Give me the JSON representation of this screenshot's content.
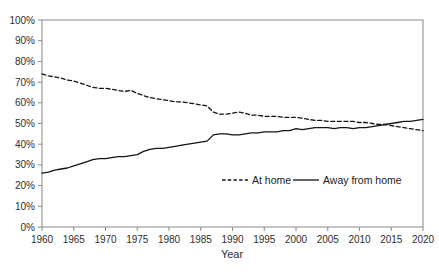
{
  "chart_data": {
    "type": "line",
    "title": "",
    "xlabel": "Year",
    "ylabel": "",
    "xlim": [
      1960,
      2020
    ],
    "ylim": [
      0,
      100
    ],
    "xtick_step": 5,
    "ytick_step": 10,
    "ytick_suffix": "%",
    "grid": false,
    "legend_position": "inside-plot-lower-right",
    "frame_color": "#8a8a8a",
    "line_color": "#141414",
    "x": [
      1960,
      1961,
      1962,
      1963,
      1964,
      1965,
      1966,
      1967,
      1968,
      1969,
      1970,
      1971,
      1972,
      1973,
      1974,
      1975,
      1976,
      1977,
      1978,
      1979,
      1980,
      1981,
      1982,
      1983,
      1984,
      1985,
      1986,
      1987,
      1988,
      1989,
      1990,
      1991,
      1992,
      1993,
      1994,
      1995,
      1996,
      1997,
      1998,
      1999,
      2000,
      2001,
      2002,
      2003,
      2004,
      2005,
      2006,
      2007,
      2008,
      2009,
      2010,
      2011,
      2012,
      2013,
      2014,
      2015,
      2016,
      2017,
      2018,
      2019,
      2020
    ],
    "series": [
      {
        "name": "At home",
        "style": "dashed",
        "color": "#141414",
        "values": [
          74,
          73,
          72.5,
          72,
          71,
          70.5,
          69.5,
          68.5,
          67.5,
          67,
          67,
          66.5,
          66,
          65.5,
          66,
          64.5,
          63.5,
          62.5,
          62,
          61.5,
          61,
          60.5,
          60.5,
          60,
          59.5,
          59,
          58.5,
          55.5,
          54.5,
          54.5,
          55,
          55.5,
          55,
          54,
          54,
          53.5,
          53.5,
          53.5,
          53,
          53,
          53,
          52.5,
          52,
          51.5,
          51.5,
          51,
          51,
          51,
          51,
          51,
          50.5,
          50.5,
          50,
          49.5,
          49.5,
          49,
          48.5,
          48,
          47.5,
          47,
          46.5
        ]
      },
      {
        "name": "Away from home",
        "style": "solid",
        "color": "#141414",
        "values": [
          26,
          26.5,
          27.5,
          28,
          28.5,
          29.5,
          30.5,
          31.5,
          32.5,
          33,
          33,
          33.5,
          34,
          34,
          34.5,
          35,
          36.5,
          37.5,
          38,
          38,
          38.5,
          39,
          39.5,
          40,
          40.5,
          41,
          41.5,
          44.5,
          45,
          45,
          44.5,
          44.5,
          45,
          45.5,
          45.5,
          46,
          46,
          46,
          46.5,
          46.5,
          47.5,
          47,
          47.5,
          48,
          48,
          48,
          47.5,
          48,
          48,
          47.5,
          48,
          48,
          48.5,
          49,
          49.5,
          50,
          50.5,
          51,
          51,
          51.5,
          52
        ]
      }
    ]
  }
}
